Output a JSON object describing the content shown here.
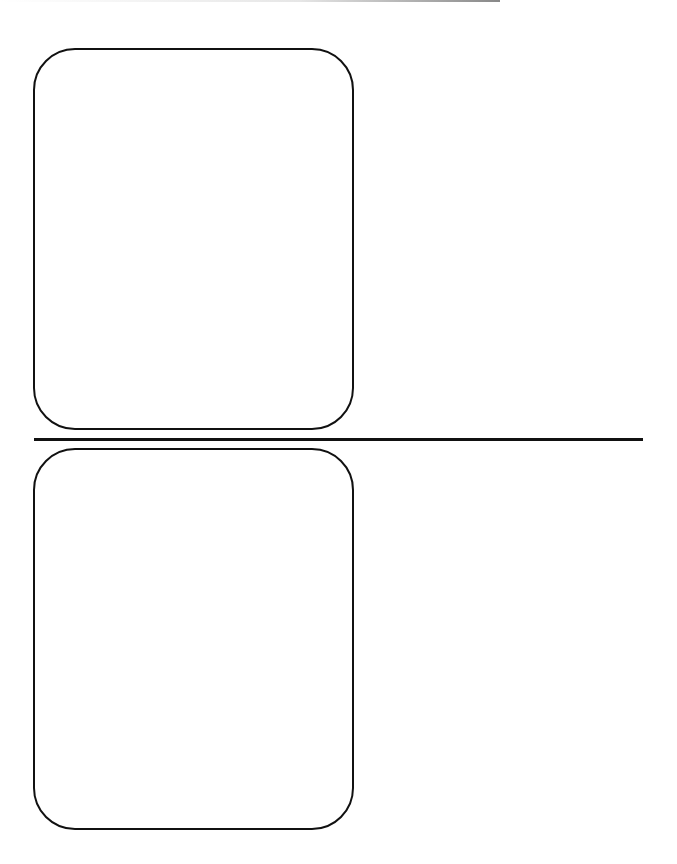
{
  "layout": {
    "panels": [
      {
        "id": "top",
        "label": ""
      },
      {
        "id": "bottom",
        "label": ""
      }
    ],
    "divider": {
      "orientation": "horizontal"
    }
  },
  "colors": {
    "stroke": "#111111",
    "background": "#ffffff"
  }
}
